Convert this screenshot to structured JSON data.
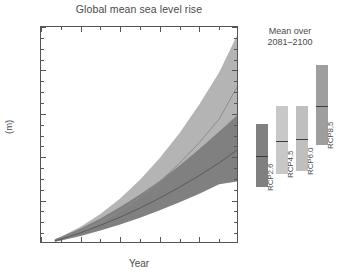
{
  "chart_data": {
    "type": "area",
    "title": "Global mean sea level rise",
    "xlabel": "Year",
    "ylabel": "(m)",
    "xlim": [
      2000,
      2100
    ],
    "ylim": [
      0.0,
      1.0
    ],
    "xticks": [
      2000,
      2020,
      2040,
      2060,
      2080,
      2100
    ],
    "xtick_labels": [
      "2000",
      "2020",
      "2040",
      "2060",
      "2080",
      "2100"
    ],
    "yticks": [
      0.0,
      0.2,
      0.4,
      0.6,
      0.8,
      1.0
    ],
    "ytick_labels": [
      "0.0",
      "0.2",
      "0.4",
      "0.6",
      "0.8",
      "1.0"
    ],
    "xminor_step": 10,
    "yminor_step": 0.05,
    "grid": false,
    "legend": "none",
    "x": [
      2007,
      2010,
      2020,
      2030,
      2040,
      2050,
      2060,
      2070,
      2080,
      2090,
      2100
    ],
    "series": [
      {
        "name": "RCP8.5",
        "color": "#b4b4b4",
        "line_color": "#8c8c8c",
        "median": [
          0.015,
          0.024,
          0.058,
          0.1,
          0.152,
          0.215,
          0.288,
          0.372,
          0.468,
          0.576,
          0.74
        ],
        "lower": [
          0.01,
          0.016,
          0.04,
          0.07,
          0.106,
          0.15,
          0.2,
          0.256,
          0.32,
          0.392,
          0.5
        ],
        "upper": [
          0.022,
          0.033,
          0.08,
          0.138,
          0.21,
          0.296,
          0.396,
          0.512,
          0.644,
          0.792,
          0.98
        ]
      },
      {
        "name": "RCP2.6",
        "color": "#808080",
        "line_color": "#5a5a5a",
        "median": [
          0.015,
          0.023,
          0.052,
          0.086,
          0.124,
          0.166,
          0.212,
          0.262,
          0.316,
          0.374,
          0.44
        ],
        "lower": [
          0.01,
          0.016,
          0.037,
          0.062,
          0.09,
          0.121,
          0.155,
          0.192,
          0.232,
          0.275,
          0.29
        ],
        "upper": [
          0.022,
          0.032,
          0.072,
          0.118,
          0.17,
          0.228,
          0.292,
          0.362,
          0.438,
          0.518,
          0.6
        ]
      }
    ],
    "side_panel": {
      "caption_line1": "Mean over",
      "caption_line2": "2081–2100",
      "bars": [
        {
          "label": "RCP2.6",
          "low": 0.26,
          "high": 0.55,
          "median": 0.4,
          "color": "#808080"
        },
        {
          "label": "RCP4.5",
          "low": 0.32,
          "high": 0.63,
          "median": 0.47,
          "color": "#c8c8c8"
        },
        {
          "label": "RCP6.0",
          "low": 0.33,
          "high": 0.63,
          "median": 0.48,
          "color": "#bfbfbf"
        },
        {
          "label": "RCP8.5",
          "low": 0.45,
          "high": 0.82,
          "median": 0.63,
          "color": "#9e9e9e"
        }
      ]
    }
  }
}
